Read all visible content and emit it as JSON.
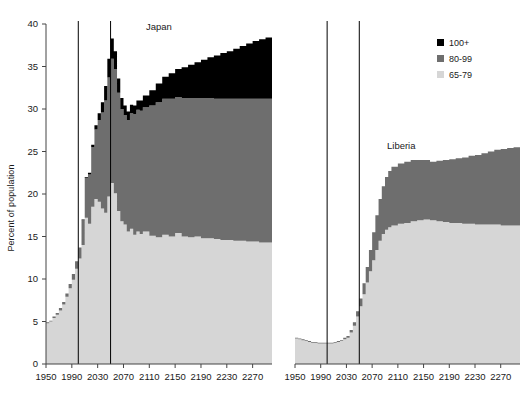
{
  "chart_data": {
    "type": "area",
    "title": "",
    "ylabel": "Percent of population",
    "xlabel": "",
    "ylim": [
      0,
      40
    ],
    "ytick_step": 5,
    "xlim": [
      1950,
      2300
    ],
    "xtick_step": 40,
    "grid": false,
    "legend_position": "top-right",
    "stacked": true,
    "legend": [
      {
        "label": "100+",
        "color": "#000000"
      },
      {
        "label": "80-99",
        "color": "#6e6e6e"
      },
      {
        "label": "65-79",
        "color": "#d6d6d6"
      }
    ],
    "yticks": [
      0,
      5,
      10,
      15,
      20,
      25,
      30,
      35,
      40
    ],
    "xticks": [
      1950,
      1990,
      2030,
      2070,
      2110,
      2150,
      2190,
      2230,
      2270
    ],
    "panels": [
      {
        "name": "Japan",
        "label": "Japan",
        "vertical_reference_lines": [
          2000,
          2050
        ],
        "x": [
          1950,
          1955,
          1960,
          1965,
          1970,
          1975,
          1980,
          1985,
          1990,
          1995,
          2000,
          2005,
          2010,
          2015,
          2020,
          2025,
          2030,
          2035,
          2040,
          2045,
          2050,
          2055,
          2060,
          2065,
          2070,
          2075,
          2080,
          2085,
          2090,
          2095,
          2100,
          2110,
          2120,
          2130,
          2140,
          2150,
          2160,
          2170,
          2180,
          2190,
          2200,
          2210,
          2220,
          2230,
          2240,
          2250,
          2260,
          2270,
          2280,
          2290,
          2300
        ],
        "series": [
          {
            "name": "65-79",
            "color": "#d6d6d6",
            "values": [
              4.8,
              5.0,
              5.4,
              5.8,
              6.3,
              7.0,
              7.9,
              8.9,
              9.9,
              11.2,
              12.4,
              14.0,
              17.2,
              16.5,
              18.5,
              19.4,
              19.1,
              18.3,
              17.8,
              19.7,
              21.3,
              20.1,
              18.0,
              16.8,
              16.4,
              15.6,
              15.9,
              15.2,
              15.6,
              15.3,
              15.6,
              15.1,
              14.9,
              15.2,
              15.0,
              15.4,
              15.0,
              14.9,
              15.0,
              14.8,
              14.8,
              14.7,
              14.6,
              14.6,
              14.5,
              14.5,
              14.4,
              14.4,
              14.3,
              14.3,
              14.3
            ]
          },
          {
            "name": "80-99",
            "color": "#6e6e6e",
            "values": [
              0.1,
              0.1,
              0.2,
              0.2,
              0.3,
              0.3,
              0.4,
              0.5,
              0.7,
              0.9,
              1.3,
              2.9,
              4.7,
              5.8,
              7.0,
              8.2,
              9.6,
              11.3,
              13.2,
              14.0,
              14.6,
              14.6,
              13.9,
              13.2,
              12.9,
              13.1,
              13.6,
              14.2,
              14.3,
              14.5,
              14.6,
              15.3,
              15.9,
              16.0,
              16.2,
              16.0,
              16.3,
              16.4,
              16.3,
              16.5,
              16.5,
              16.5,
              16.6,
              16.6,
              16.7,
              16.7,
              16.8,
              16.8,
              16.9,
              16.9,
              16.9
            ]
          },
          {
            "name": "100+",
            "color": "#000000",
            "values": [
              0.0,
              0.0,
              0.0,
              0.0,
              0.0,
              0.0,
              0.0,
              0.0,
              0.0,
              0.0,
              0.0,
              0.1,
              0.1,
              0.2,
              0.3,
              0.5,
              0.8,
              1.2,
              1.7,
              2.2,
              2.4,
              2.1,
              1.7,
              1.3,
              1.1,
              1.0,
              1.0,
              1.0,
              1.1,
              1.2,
              1.4,
              1.8,
              2.2,
              2.6,
              3.0,
              3.3,
              3.6,
              3.9,
              4.2,
              4.5,
              4.8,
              5.1,
              5.4,
              5.6,
              5.9,
              6.2,
              6.5,
              6.8,
              7.0,
              7.2,
              7.3
            ]
          }
        ]
      },
      {
        "name": "Liberia",
        "label": "Liberia",
        "vertical_reference_lines": [
          2000,
          2050
        ],
        "x": [
          1950,
          1955,
          1960,
          1965,
          1970,
          1975,
          1980,
          1985,
          1990,
          1995,
          2000,
          2005,
          2010,
          2015,
          2020,
          2025,
          2030,
          2035,
          2040,
          2045,
          2050,
          2055,
          2060,
          2065,
          2070,
          2075,
          2080,
          2085,
          2090,
          2095,
          2100,
          2110,
          2120,
          2130,
          2140,
          2150,
          2160,
          2170,
          2180,
          2190,
          2200,
          2210,
          2220,
          2230,
          2240,
          2250,
          2260,
          2270,
          2280,
          2290,
          2300
        ],
        "series": [
          {
            "name": "65-79",
            "color": "#d6d6d6",
            "values": [
              3.0,
              2.9,
              2.8,
              2.7,
              2.6,
              2.5,
              2.5,
              2.4,
              2.4,
              2.4,
              2.4,
              2.4,
              2.5,
              2.6,
              2.7,
              2.9,
              3.1,
              3.7,
              4.5,
              5.6,
              6.8,
              8.2,
              9.6,
              10.9,
              12.2,
              13.4,
              14.5,
              15.3,
              15.8,
              16.1,
              16.3,
              16.5,
              16.6,
              16.8,
              16.9,
              17.0,
              16.9,
              16.8,
              16.7,
              16.6,
              16.6,
              16.5,
              16.5,
              16.4,
              16.4,
              16.4,
              16.4,
              16.3,
              16.3,
              16.3,
              16.3
            ]
          },
          {
            "name": "80-99",
            "color": "#6e6e6e",
            "values": [
              0.1,
              0.1,
              0.1,
              0.1,
              0.1,
              0.1,
              0.1,
              0.1,
              0.1,
              0.1,
              0.1,
              0.1,
              0.1,
              0.1,
              0.1,
              0.2,
              0.2,
              0.3,
              0.4,
              0.6,
              0.9,
              1.3,
              1.8,
              2.5,
              3.3,
              4.1,
              4.9,
              5.6,
              6.2,
              6.6,
              6.9,
              7.1,
              7.2,
              7.2,
              7.1,
              7.0,
              6.9,
              7.1,
              7.3,
              7.5,
              7.6,
              7.8,
              8.0,
              8.2,
              8.4,
              8.6,
              8.8,
              9.0,
              9.1,
              9.2,
              9.3
            ]
          },
          {
            "name": "100+",
            "color": "#000000",
            "values": [
              0.0,
              0.0,
              0.0,
              0.0,
              0.0,
              0.0,
              0.0,
              0.0,
              0.0,
              0.0,
              0.0,
              0.0,
              0.0,
              0.0,
              0.0,
              0.0,
              0.0,
              0.0,
              0.0,
              0.0,
              0.0,
              0.0,
              0.0,
              0.0,
              0.0,
              0.0,
              0.0,
              0.0,
              0.0,
              0.0,
              0.0,
              0.0,
              0.0,
              0.0,
              0.0,
              0.0,
              0.0,
              0.0,
              0.0,
              0.0,
              0.0,
              0.0,
              0.0,
              0.0,
              0.0,
              0.0,
              0.0,
              0.0,
              0.0,
              0.0,
              0.0
            ]
          }
        ]
      }
    ]
  }
}
